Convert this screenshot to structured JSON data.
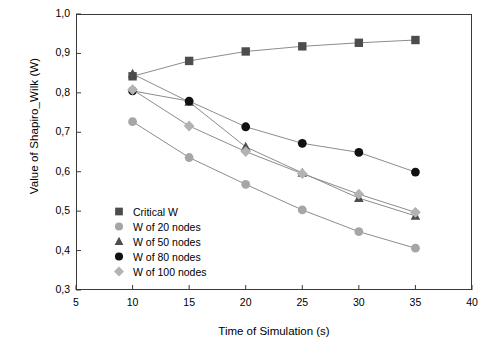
{
  "chart_data": {
    "type": "line",
    "title": "",
    "xlabel": "Time of Simulation (s)",
    "ylabel": "Value of Shapiro_Wilk (W)",
    "xlim": [
      5,
      40
    ],
    "ylim": [
      0.3,
      1.0
    ],
    "xticks": [
      "5",
      "10",
      "15",
      "20",
      "25",
      "30",
      "35",
      "40"
    ],
    "yticks": [
      "0,3",
      "0,4",
      "0,5",
      "0,6",
      "0,7",
      "0,8",
      "0,9",
      "1,0"
    ],
    "grid": false,
    "legend_position": "lower-left-inside",
    "x": [
      10,
      15,
      20,
      25,
      30,
      35
    ],
    "series": [
      {
        "name": "Critical W",
        "marker": "square",
        "color": "#4d4d4d",
        "values": [
          0.842,
          0.881,
          0.905,
          0.918,
          0.927,
          0.934
        ]
      },
      {
        "name": "W of 20 nodes",
        "marker": "circle-gray",
        "color": "#a6a6a6",
        "values": [
          0.727,
          0.636,
          0.568,
          0.503,
          0.448,
          0.406
        ]
      },
      {
        "name": "W of 50 nodes",
        "marker": "triangle",
        "color": "#4d4d4d",
        "values": [
          0.848,
          0.777,
          0.663,
          0.597,
          0.533,
          0.488
        ]
      },
      {
        "name": "W of 80 nodes",
        "marker": "circle-black",
        "color": "#111111",
        "values": [
          0.805,
          0.779,
          0.714,
          0.672,
          0.649,
          0.599
        ]
      },
      {
        "name": "W of 100 nodes",
        "marker": "diamond",
        "color": "#b3b3b3",
        "values": [
          0.808,
          0.716,
          0.651,
          0.595,
          0.543,
          0.497
        ]
      }
    ]
  },
  "axes": {
    "ylabel": "Value of Shapiro_Wilk (W)",
    "xlabel": "Time of Simulation (s)"
  },
  "legend": {
    "items": [
      {
        "label": "Critical W"
      },
      {
        "label": "W of 20 nodes"
      },
      {
        "label": "W of 50 nodes"
      },
      {
        "label": "W of 80 nodes"
      },
      {
        "label": "W of 100 nodes"
      }
    ]
  }
}
